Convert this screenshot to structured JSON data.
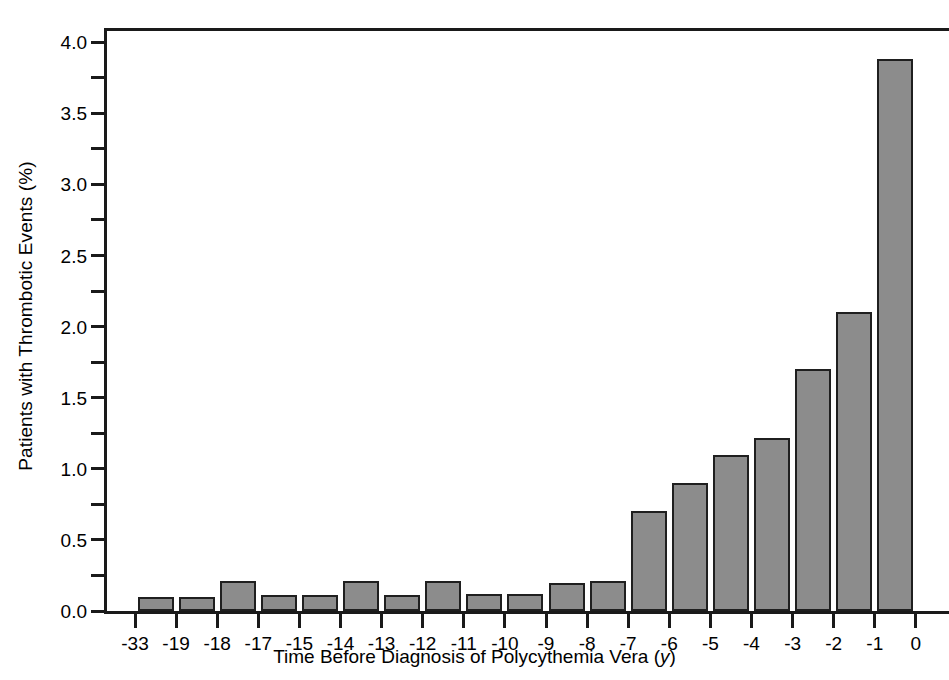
{
  "chart_data": {
    "type": "bar",
    "title": "",
    "xlabel": "Time Before Diagnosis of Polycythemia Vera (y)",
    "ylabel": "Patients with Thrombotic Events (%)",
    "categories": [
      "-33",
      "-19",
      "-18",
      "-17",
      "-15",
      "-14",
      "-13",
      "-12",
      "-11",
      "-10",
      "-9",
      "-8",
      "-7",
      "-6",
      "-5",
      "-4",
      "-3",
      "-2",
      "-1"
    ],
    "values": [
      0.1,
      0.1,
      0.21,
      0.11,
      0.11,
      0.21,
      0.11,
      0.21,
      0.12,
      0.12,
      0.2,
      0.21,
      0.7,
      0.9,
      1.1,
      1.22,
      1.7,
      2.1,
      3.88
    ],
    "ylim": [
      0.0,
      4.1
    ],
    "ytick_labels": [
      "0.0",
      "0.5",
      "1.0",
      "1.5",
      "2.0",
      "2.5",
      "3.0",
      "3.5",
      "4.0"
    ],
    "ytick_values": [
      0.0,
      0.5,
      1.0,
      1.5,
      2.0,
      2.5,
      3.0,
      3.5,
      4.0
    ],
    "ytick_minor_values": [
      0.25,
      0.75,
      1.25,
      1.75,
      2.25,
      2.75,
      3.25,
      3.75
    ],
    "xtick_labels": [
      "-33",
      "-19",
      "-18",
      "-17",
      "-15",
      "-14",
      "-13",
      "-12",
      "-11",
      "-10",
      "-9",
      "-8",
      "-7",
      "-6",
      "-5",
      "-4",
      "-3",
      "-2",
      "-1",
      "0"
    ],
    "grid": false,
    "legend": null,
    "bar_color": "#8c8c8c",
    "bar_edge_color": "#1f1f1f",
    "axis_color": "#1a1a1a"
  },
  "axes": {
    "ylabel_text": "Patients with Thrombotic Events (%)",
    "xlabel_prefix": "Time Before Diagnosis of Polycythemia Vera (",
    "xlabel_italic": "y",
    "xlabel_suffix": ")"
  }
}
